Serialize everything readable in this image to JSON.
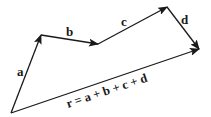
{
  "diagram": {
    "stroke_color": "#1a1a1a",
    "background": "#ffffff",
    "points": {
      "O": [
        11,
        113
      ],
      "A": [
        41,
        35
      ],
      "B": [
        98,
        44
      ],
      "C": [
        167,
        7
      ],
      "D": [
        199,
        49
      ]
    },
    "vectors": [
      {
        "name": "a",
        "label": "a",
        "from": "O",
        "to": "A",
        "label_pos": [
          21,
          73
        ]
      },
      {
        "name": "b",
        "label": "b",
        "from": "A",
        "to": "B",
        "label_pos": [
          70,
          37
        ]
      },
      {
        "name": "c",
        "label": "c",
        "from": "B",
        "to": "C",
        "label_pos": [
          125,
          25
        ]
      },
      {
        "name": "d",
        "label": "d",
        "from": "C",
        "to": "D",
        "label_pos": [
          186,
          21
        ]
      },
      {
        "name": "r",
        "label": "r = a + b + c + d",
        "from": "O",
        "to": "D"
      }
    ],
    "resultant_label": "r = a + b + c + d"
  }
}
